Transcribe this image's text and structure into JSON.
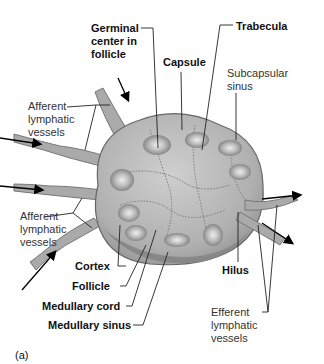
{
  "figure": {
    "panel_label": "(a)",
    "labels": [
      {
        "id": "germinal",
        "text": "Germinal\ncenter in\nfollicle",
        "bold": true
      },
      {
        "id": "capsule",
        "text": "Capsule",
        "bold": true
      },
      {
        "id": "trabecula",
        "text": "Trabecula",
        "bold": true
      },
      {
        "id": "subcapsular",
        "text": "Subcapsular\nsinus",
        "bold": false
      },
      {
        "id": "afferent_top",
        "text": "Afferent\nlymphatic\nvessels",
        "bold": false
      },
      {
        "id": "afferent_bottom",
        "text": "Afferent\nlymphatic\nvessels",
        "bold": false
      },
      {
        "id": "cortex",
        "text": "Cortex",
        "bold": true
      },
      {
        "id": "follicle",
        "text": "Follicle",
        "bold": true
      },
      {
        "id": "medullary_cord",
        "text": "Medullary cord",
        "bold": true
      },
      {
        "id": "medullary_sinus",
        "text": "Medullary sinus",
        "bold": true
      },
      {
        "id": "hilus",
        "text": "Hilus",
        "bold": true
      },
      {
        "id": "efferent",
        "text": "Efferent\nlymphatic\nvessels",
        "bold": false
      }
    ]
  },
  "colors": {
    "node_fill": "#b8b8b8",
    "node_dark": "#7a7a7a",
    "follicle": "#8a8a8a",
    "germinal": "#d8d8d8",
    "leader": "#222222"
  }
}
